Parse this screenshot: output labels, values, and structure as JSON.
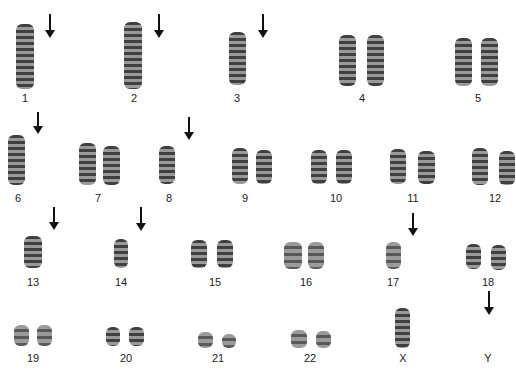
{
  "figure": {
    "type": "karyotype",
    "rows": [
      {
        "items": [
          {
            "label": "1",
            "copies": 1,
            "arrow": true
          },
          {
            "label": "2",
            "copies": 1,
            "arrow": true
          },
          {
            "label": "3",
            "copies": 1,
            "arrow": true
          },
          {
            "label": "4",
            "copies": 2,
            "arrow": false
          },
          {
            "label": "5",
            "copies": 2,
            "arrow": false
          }
        ]
      },
      {
        "items": [
          {
            "label": "6",
            "copies": 1,
            "arrow": true
          },
          {
            "label": "7",
            "copies": 2,
            "arrow": false
          },
          {
            "label": "8",
            "copies": 1,
            "arrow": true
          },
          {
            "label": "9",
            "copies": 2,
            "arrow": false
          },
          {
            "label": "10",
            "copies": 2,
            "arrow": false
          },
          {
            "label": "11",
            "copies": 2,
            "arrow": false
          },
          {
            "label": "12",
            "copies": 2,
            "arrow": false
          }
        ]
      },
      {
        "items": [
          {
            "label": "13",
            "copies": 1,
            "arrow": true
          },
          {
            "label": "14",
            "copies": 1,
            "arrow": true
          },
          {
            "label": "15",
            "copies": 2,
            "arrow": false
          },
          {
            "label": "16",
            "copies": 2,
            "arrow": false
          },
          {
            "label": "17",
            "copies": 1,
            "arrow": true
          },
          {
            "label": "18",
            "copies": 2,
            "arrow": false
          }
        ]
      },
      {
        "items": [
          {
            "label": "19",
            "copies": 2,
            "arrow": false
          },
          {
            "label": "20",
            "copies": 2,
            "arrow": false
          },
          {
            "label": "21",
            "copies": 2,
            "arrow": false
          },
          {
            "label": "22",
            "copies": 2,
            "arrow": false
          },
          {
            "label": "X",
            "copies": 1,
            "arrow": false
          },
          {
            "label": "Y",
            "copies": 0,
            "arrow": true
          }
        ]
      }
    ]
  },
  "labels": {
    "c1": "1",
    "c2": "2",
    "c3": "3",
    "c4": "4",
    "c5": "5",
    "c6": "6",
    "c7": "7",
    "c8": "8",
    "c9": "9",
    "c10": "10",
    "c11": "11",
    "c12": "12",
    "c13": "13",
    "c14": "14",
    "c15": "15",
    "c16": "16",
    "c17": "17",
    "c18": "18",
    "c19": "19",
    "c20": "20",
    "c21": "21",
    "c22": "22",
    "cX": "X",
    "cY": "Y"
  }
}
